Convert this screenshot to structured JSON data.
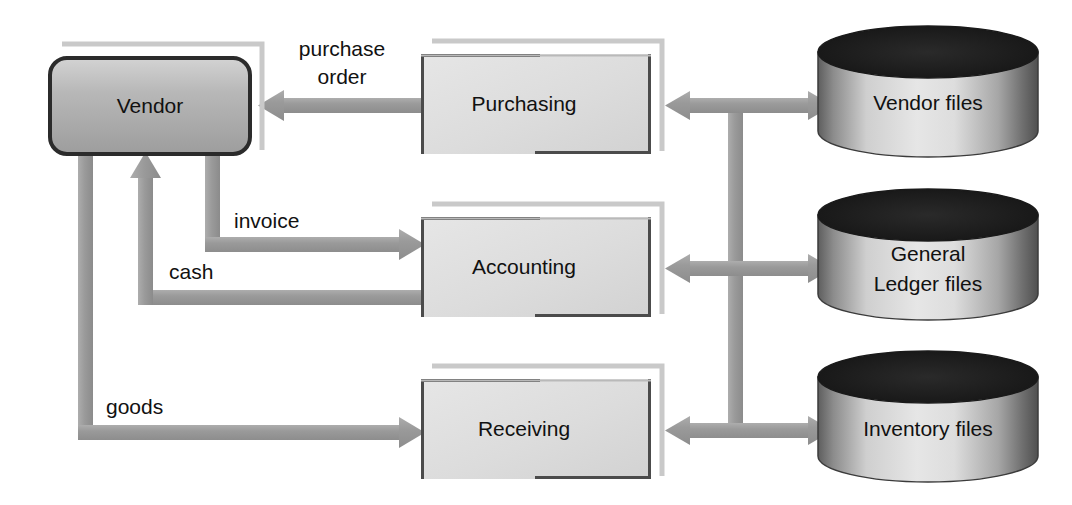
{
  "diagram": {
    "background_color": "#ffffff",
    "palette": {
      "arrow_gray": "#9a9a9a",
      "arrow_gray_dark": "#8b8b8b",
      "box_fill_light": "#dcdcdc",
      "box_fill_light2": "#e4e4e4",
      "box_border_dark": "#555555",
      "box_shadow_gray": "#bdbdbd",
      "vendor_fill_dark": "#a8a8a8",
      "vendor_border": "#2b2b2b",
      "cylinder_top_black": "#1a1a1a",
      "cylinder_body_light": "#e0e0e0",
      "cylinder_body_dark": "#707070",
      "text_color": "#111111"
    },
    "external_entity": {
      "id": "vendor",
      "label": "Vendor",
      "shape": "rounded-rectangle"
    },
    "processes": [
      {
        "id": "purchasing",
        "label": "Purchasing",
        "shape": "rectangle"
      },
      {
        "id": "accounting",
        "label": "Accounting",
        "shape": "rectangle"
      },
      {
        "id": "receiving",
        "label": "Receiving",
        "shape": "rectangle"
      }
    ],
    "data_stores": [
      {
        "id": "vendor-files",
        "label_lines": [
          "Vendor files"
        ],
        "label": "Vendor files",
        "shape": "cylinder"
      },
      {
        "id": "gl-files",
        "label_lines": [
          "General",
          "Ledger files"
        ],
        "label": "General Ledger files",
        "shape": "cylinder"
      },
      {
        "id": "inventory-files",
        "label_lines": [
          "Inventory files"
        ],
        "label": "Inventory files",
        "shape": "cylinder"
      }
    ],
    "flows": [
      {
        "id": "purchase-order",
        "label_lines": [
          "purchase",
          "order"
        ],
        "label": "purchase order",
        "from": "purchasing",
        "to": "vendor",
        "direction": "one-way",
        "route": "horizontal"
      },
      {
        "id": "invoice",
        "label_lines": [
          "invoice"
        ],
        "label": "invoice",
        "from": "vendor",
        "to": "accounting",
        "direction": "one-way",
        "route": "down-then-right"
      },
      {
        "id": "cash",
        "label_lines": [
          "cash"
        ],
        "label": "cash",
        "from": "accounting",
        "to": "vendor",
        "direction": "one-way",
        "route": "left-then-up"
      },
      {
        "id": "goods",
        "label_lines": [
          "goods"
        ],
        "label": "goods",
        "from": "vendor",
        "to": "receiving",
        "direction": "one-way",
        "route": "down-then-right"
      },
      {
        "id": "purchasing-vendor-files",
        "label_lines": [],
        "label": "",
        "from": "purchasing",
        "to": "vendor-files",
        "direction": "two-way",
        "route": "horizontal"
      },
      {
        "id": "accounting-gl-files",
        "label_lines": [],
        "label": "",
        "from": "accounting",
        "to": "gl-files",
        "direction": "two-way",
        "route": "horizontal"
      },
      {
        "id": "receiving-inventory-files",
        "label_lines": [],
        "label": "",
        "from": "receiving",
        "to": "inventory-files",
        "direction": "two-way",
        "route": "horizontal"
      },
      {
        "id": "store-trunk",
        "label_lines": [],
        "label": "",
        "from": "vendor-files-bus",
        "to": "inventory-files-bus",
        "direction": "none",
        "route": "vertical-bus"
      }
    ]
  }
}
